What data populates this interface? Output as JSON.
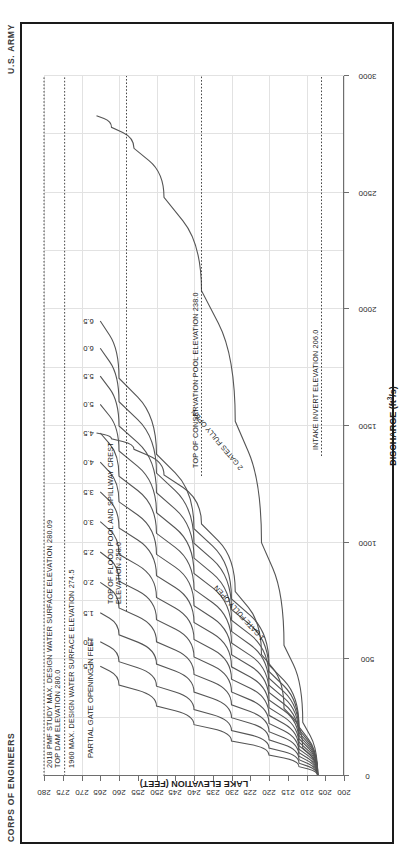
{
  "sheet": {
    "corner_left": "CORPS OF ENGINEERS",
    "corner_right": "U.S. ARMY"
  },
  "chart_data": {
    "type": "line",
    "title": "",
    "xlabel": "DISCHARGE (ft³/s)",
    "ylabel": "LAKE ELEVATION (FEET)",
    "xlim": [
      0,
      3000
    ],
    "ylim": [
      200,
      280
    ],
    "xticks": [
      0,
      500,
      1000,
      1500,
      2000,
      2500,
      3000
    ],
    "xticklabels": [
      "0",
      "500",
      "1000",
      "1500",
      "2000",
      "2500",
      "3000"
    ],
    "yticks": [
      200,
      205,
      210,
      215,
      220,
      225,
      230,
      235,
      240,
      245,
      250,
      255,
      260,
      265,
      270,
      275,
      280
    ],
    "yticklabels": [
      "200",
      "205",
      "210",
      "215",
      "220",
      "225",
      "230",
      "235",
      "240",
      "245",
      "250",
      "255",
      "260",
      "265",
      "270",
      "275",
      "280"
    ],
    "grid": true,
    "legend": "none",
    "series_group_label": "PARTIAL GATE OPENING IN FEET",
    "series": [
      {
        "name": "0.5",
        "label": "0.5",
        "x": [
          0,
          40,
          90,
          150,
          220,
          300,
          390,
          470
        ],
        "y": [
          207,
          212,
          220,
          230,
          240,
          250,
          260,
          265
        ]
      },
      {
        "name": "1.0",
        "label": "1.0",
        "x": [
          0,
          55,
          120,
          195,
          285,
          385,
          490,
          575
        ],
        "y": [
          207,
          212,
          220,
          230,
          240,
          250,
          260,
          265
        ]
      },
      {
        "name": "1.5",
        "label": "1.5",
        "x": [
          0,
          70,
          155,
          250,
          360,
          480,
          605,
          700
        ],
        "y": [
          207,
          212,
          220,
          230,
          240,
          250,
          260,
          265
        ]
      },
      {
        "name": "2.0",
        "label": "2.0",
        "x": [
          0,
          85,
          190,
          305,
          435,
          575,
          720,
          830
        ],
        "y": [
          207,
          212,
          220,
          230,
          240,
          250,
          260,
          265
        ]
      },
      {
        "name": "2.5",
        "label": "2.5",
        "x": [
          0,
          100,
          225,
          360,
          510,
          670,
          835,
          960
        ],
        "y": [
          207,
          212,
          220,
          230,
          240,
          250,
          260,
          265
        ]
      },
      {
        "name": "3.0",
        "label": "3.0",
        "x": [
          0,
          115,
          260,
          415,
          585,
          765,
          950,
          1090
        ],
        "y": [
          207,
          212,
          220,
          230,
          240,
          250,
          260,
          265
        ]
      },
      {
        "name": "3.5",
        "label": "3.5",
        "x": [
          0,
          130,
          293,
          468,
          658,
          858,
          1063,
          1218
        ],
        "y": [
          207,
          212,
          220,
          230,
          240,
          250,
          260,
          265
        ]
      },
      {
        "name": "4.0",
        "label": "4.0",
        "x": [
          0,
          145,
          326,
          520,
          730,
          950,
          1175,
          1345
        ],
        "y": [
          207,
          212,
          220,
          230,
          240,
          250,
          260,
          265
        ]
      },
      {
        "name": "4.5",
        "label": "4.5",
        "x": [
          0,
          160,
          358,
          570,
          800,
          1040,
          1285,
          1470
        ],
        "y": [
          207,
          212,
          220,
          230,
          240,
          250,
          260,
          265
        ]
      },
      {
        "name": "5.0",
        "label": "5.0",
        "x": [
          0,
          173,
          389,
          620,
          868,
          1128,
          1393,
          1593
        ],
        "y": [
          207,
          212,
          220,
          230,
          240,
          250,
          260,
          265
        ]
      },
      {
        "name": "5.5",
        "label": "5.5",
        "x": [
          0,
          186,
          419,
          668,
          934,
          1214,
          1500,
          1714
        ],
        "y": [
          207,
          212,
          220,
          230,
          240,
          250,
          260,
          265
        ]
      },
      {
        "name": "6.0",
        "label": "6.0",
        "x": [
          0,
          199,
          448,
          714,
          998,
          1298,
          1604,
          1833
        ],
        "y": [
          207,
          212,
          220,
          230,
          240,
          250,
          260,
          265
        ]
      },
      {
        "name": "6.5",
        "label": "6.5",
        "x": [
          0,
          211,
          476,
          759,
          1060,
          1379,
          1705,
          1950
        ],
        "y": [
          207,
          212,
          220,
          230,
          240,
          250,
          260,
          265
        ]
      },
      {
        "name": "1 GATE FULLY OPEN",
        "label": "1 GATE FULLY OPEN",
        "x": [
          0,
          120,
          290,
          520,
          790,
          1080,
          1290,
          1400,
          1445,
          1470
        ],
        "y": [
          207,
          211,
          216,
          222,
          229,
          238,
          248,
          256,
          262,
          266
        ]
      },
      {
        "name": "2 GATES FULLY OPEN",
        "label": "2 GATES FULLY OPEN",
        "x": [
          0,
          230,
          560,
          1000,
          1520,
          2080,
          2480,
          2690,
          2780,
          2830
        ],
        "y": [
          207,
          211,
          216,
          222,
          229,
          238,
          248,
          256,
          262,
          266
        ]
      }
    ],
    "reference_lines": [
      {
        "name": "top-dam-elevation",
        "value": 280.0,
        "axis": "y",
        "style": "dotted",
        "label": "2018 PMF STUDY MAX. DESIGN WATER SURFACE ELEVATION 280.09\nTOP DAM ELEVATION 280.0"
      },
      {
        "name": "1960-max-design-wse",
        "value": 274.5,
        "axis": "y",
        "style": "dotted",
        "label": "1960 MAX. DESIGN WATER SURFACE ELEVATION 274.5"
      },
      {
        "name": "top-flood-pool-spillway-crest",
        "value": 258.0,
        "axis": "y",
        "style": "dotted",
        "label": "TOP OF FLOOD POOL AND SPILLWAY CREST\nELEVATION 258.0"
      },
      {
        "name": "top-conservation-pool",
        "value": 238.0,
        "axis": "y",
        "style": "dotted",
        "label": "TOP OF CONSERVATION POOL ELEVATION  238.0"
      },
      {
        "name": "intake-invert-elevation",
        "value": 206.0,
        "axis": "y",
        "style": "dotted",
        "label": "INTAKE INVERT ELEVATION  206.0"
      }
    ],
    "annotations": [
      {
        "name": "pmf-dam-crest-note",
        "line1": "2018 PMF STUDY MAX. DESIGN WATER SURFACE ELEVATION 280.09",
        "line2": "TOP DAM ELEVATION 280.0"
      },
      {
        "name": "design-wse-1960-note",
        "line1": "1960 MAX. DESIGN WATER SURFACE ELEVATION 274.5",
        "line2": ""
      },
      {
        "name": "flood-pool-note",
        "line1": "TOP OF FLOOD POOL AND SPILLWAY CREST",
        "line2": "ELEVATION 258.0"
      },
      {
        "name": "conservation-pool-note",
        "line1": "TOP OF CONSERVATION POOL ELEVATION  238.0",
        "line2": ""
      },
      {
        "name": "intake-invert-note",
        "line1": "INTAKE INVERT ELEVATION  206.0",
        "line2": ""
      },
      {
        "name": "partial-gate-opening-note",
        "line1": "PARTIAL GATE OPENING IN FEET",
        "line2": ""
      }
    ]
  }
}
